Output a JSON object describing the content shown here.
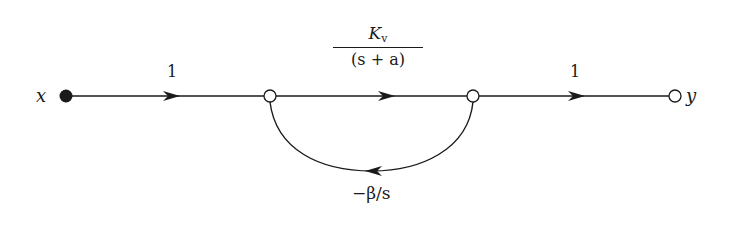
{
  "diagram": {
    "type": "signal-flow-graph",
    "stroke_color": "#1a1a1a",
    "nodes": [
      {
        "id": "x",
        "label": "x",
        "kind": "source",
        "filled": true
      },
      {
        "id": "n1",
        "label": "",
        "kind": "intermediate",
        "filled": false
      },
      {
        "id": "n2",
        "label": "",
        "kind": "intermediate",
        "filled": false
      },
      {
        "id": "y",
        "label": "y",
        "kind": "sink",
        "filled": false
      }
    ],
    "branches": [
      {
        "from": "x",
        "to": "n1",
        "gain": "1"
      },
      {
        "from": "n1",
        "to": "n2",
        "gain_numerator": "K",
        "gain_numerator_subscript": "v",
        "gain_denominator": "(s + a)"
      },
      {
        "from": "n2",
        "to": "y",
        "gain": "1"
      },
      {
        "from": "n2",
        "to": "n1",
        "gain": "−β/s",
        "feedback": true
      }
    ]
  },
  "labels": {
    "input": "x",
    "output": "y",
    "gain_left": "1",
    "gain_right": "1",
    "gain_mid_num": "K",
    "gain_mid_sub": "v",
    "gain_mid_den": "(s + a)",
    "gain_feedback": "−β/s"
  }
}
